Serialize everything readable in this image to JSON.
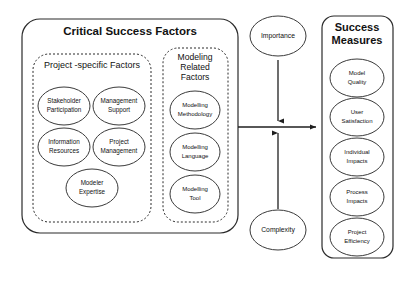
{
  "diagram": {
    "csf_panel": {
      "title": "Critical Success Factors",
      "project_group": {
        "label": "Project -specific Factors",
        "nodes": [
          {
            "line1": "Stakeholder",
            "line2": "Participation"
          },
          {
            "line1": "Management",
            "line2": "Support"
          },
          {
            "line1": "Information",
            "line2": "Resources"
          },
          {
            "line1": "Project",
            "line2": "Management"
          },
          {
            "line1": "Modeler",
            "line2": "Expertise"
          }
        ]
      },
      "modeling_group": {
        "label_line1": "Modeling",
        "label_line2": "Related",
        "label_line3": "Factors",
        "nodes": [
          {
            "line1": "Modelling",
            "line2": "Methodology"
          },
          {
            "line1": "Modelling",
            "line2": "Language"
          },
          {
            "line1": "Modelling",
            "line2": "Tool"
          }
        ]
      }
    },
    "moderators": {
      "top": "Importance",
      "bottom": "Complexity"
    },
    "measures_panel": {
      "title_line1": "Success",
      "title_line2": "Measures",
      "nodes": [
        {
          "line1": "Model",
          "line2": "Quality"
        },
        {
          "line1": "User",
          "line2": "Satisfaction"
        },
        {
          "line1": "Individual",
          "line2": "Impacts"
        },
        {
          "line1": "Process",
          "line2": "Impacts"
        },
        {
          "line1": "Project",
          "line2": "Efficiency"
        }
      ]
    },
    "colors": {
      "background": "#ffffff",
      "stroke": "#2b2b2b",
      "text": "#111111"
    }
  }
}
